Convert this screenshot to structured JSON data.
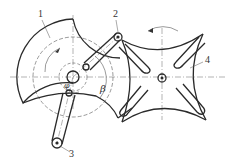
{
  "diagram": {
    "type": "Geneva (intermittent) mechanism sketch",
    "labels": [
      {
        "id": "1",
        "text": "1",
        "x": 38,
        "y": 17
      },
      {
        "id": "2",
        "text": "2",
        "x": 113,
        "y": 17
      },
      {
        "id": "3",
        "text": "3",
        "x": 69,
        "y": 157
      },
      {
        "id": "4",
        "text": "4",
        "x": 205,
        "y": 63
      }
    ],
    "angles": {
      "beta": "β",
      "phi": "φ"
    },
    "colors": {
      "line": "#2a2a2a",
      "thin": "#555555",
      "background": "#ffffff"
    }
  }
}
